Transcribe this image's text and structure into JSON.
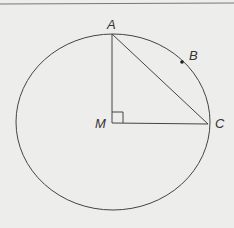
{
  "diagram": {
    "type": "geometry",
    "labels": {
      "A": "A",
      "B": "B",
      "C": "C",
      "M": "M"
    },
    "points": {
      "A": [
        112,
        34
      ],
      "B": [
        182,
        62
      ],
      "C": [
        208,
        123
      ],
      "M": [
        112,
        123
      ]
    },
    "circle": {
      "cx": 113,
      "cy": 122,
      "rx": 97,
      "ry": 88
    },
    "segments": [
      [
        "A",
        "M"
      ],
      [
        "M",
        "C"
      ],
      [
        "A",
        "C"
      ]
    ],
    "right_angle_at": "M",
    "colors": {
      "stroke": "#444444",
      "background": "#ededeb"
    }
  }
}
